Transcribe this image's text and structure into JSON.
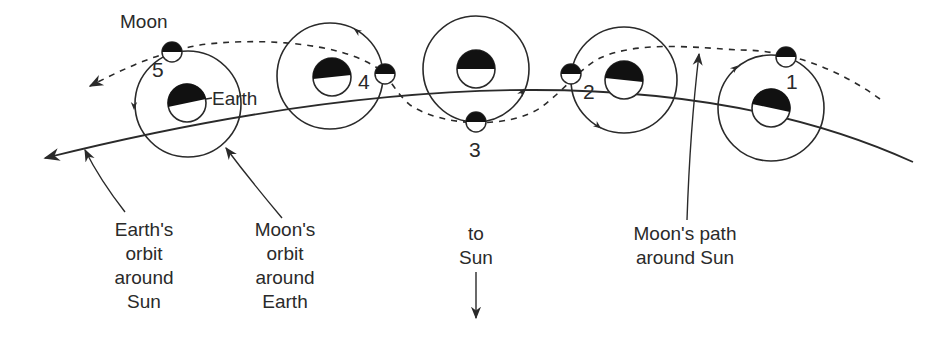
{
  "diagram": {
    "colors": {
      "ink": "#2a2a2a",
      "background": "#ffffff"
    },
    "labels": {
      "moon": "Moon",
      "earth": "Earth",
      "earths_orbit": "Earth's\norbit\naround\nSun",
      "moons_orbit": "Moon's\norbit\naround\nEarth",
      "to_sun": "to\nSun",
      "moons_path": "Moon's path\naround Sun"
    },
    "positions": [
      {
        "number": "1",
        "earth_center": [
          771,
          108
        ],
        "moon_center": [
          786,
          57
        ]
      },
      {
        "number": "2",
        "earth_center": [
          624,
          80
        ],
        "moon_center": [
          571,
          74
        ]
      },
      {
        "number": "3",
        "earth_center": [
          476,
          69
        ],
        "moon_center": [
          476,
          122
        ]
      },
      {
        "number": "4",
        "earth_center": [
          332,
          77
        ],
        "moon_center": [
          385,
          74
        ]
      },
      {
        "number": "5",
        "earth_center": [
          187,
          103
        ],
        "moon_center": [
          172,
          52
        ]
      }
    ],
    "orbit_radius": 53,
    "earth_radius": 19,
    "moon_radius": 10
  }
}
